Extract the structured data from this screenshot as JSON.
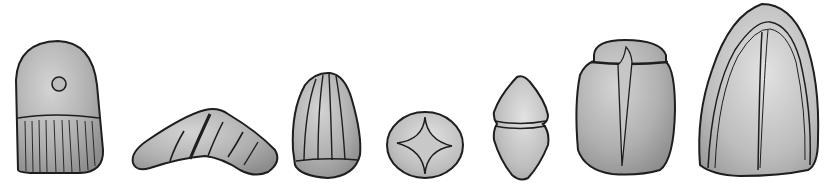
{
  "figure": {
    "background": "#ffffff",
    "fill_color": "#a9a9a9",
    "highlight_color": "#d2d2d2",
    "stroke_color": "#1e1e1e",
    "objects": [
      {
        "name": "perforated-rounded-stone",
        "features": [
          "hole",
          "vertical-grooves-lower-half"
        ]
      },
      {
        "name": "boomerang-shaped-stone",
        "features": [
          "diagonal-grooves"
        ]
      },
      {
        "name": "grooved-cone-stone",
        "features": [
          "vertical-ribs"
        ]
      },
      {
        "name": "round-disc-stone",
        "features": [
          "four-point-star-incision"
        ]
      },
      {
        "name": "double-cone-stone",
        "features": [
          "central-groove"
        ]
      },
      {
        "name": "scarab-shaped-stone",
        "features": [
          "head-segment",
          "central-ridge"
        ]
      },
      {
        "name": "large-dome-stone",
        "features": [
          "arched-groove",
          "central-line"
        ]
      }
    ]
  }
}
